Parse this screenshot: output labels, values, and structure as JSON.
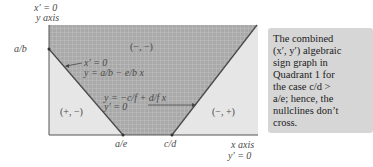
{
  "diagram": {
    "y_axis_label_top": "x′ = 0",
    "y_axis_label_bottom": "y axis",
    "x_axis_label_top": "x axis",
    "x_axis_label_bottom": "y′ = 0",
    "tick_y": "a/b",
    "tick_x_left": "a/e",
    "tick_x_right": "c/d",
    "region_top": "(−, −)",
    "region_left": "(+, −)",
    "region_right": "(−, +)",
    "nullcline_x_line1": "x′ = 0",
    "nullcline_x_line2": "y = a/b − e/b x",
    "nullcline_y_line1": "y = −c/f + d/f x",
    "nullcline_y_line2": "y′ = 0",
    "colors": {
      "dark_region": "#a8a8a8",
      "grid": "#c4c4c4",
      "light_region": "#e8e8e8",
      "line": "#555555",
      "caption_bg": "#d6d6d6"
    }
  },
  "caption": {
    "lines": [
      "The combined",
      "(x′, y′) algebraic",
      "sign graph in",
      "Quadrant 1 for",
      "the case c/d >",
      "a/e; hence, the",
      "nullclines don’t",
      "cross."
    ]
  }
}
